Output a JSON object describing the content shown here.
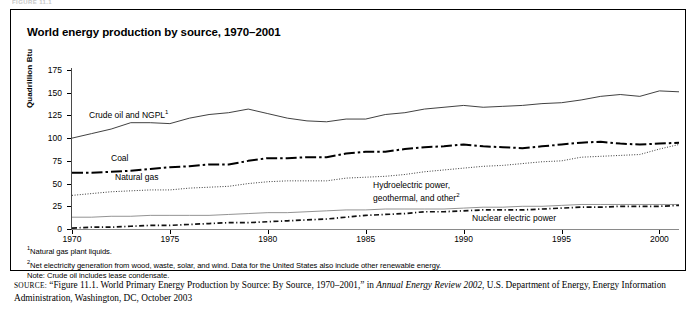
{
  "scan_header": "FIGURE 11.1",
  "figure": {
    "title": "World energy production by source, 1970–2001"
  },
  "axes": {
    "ylabel": "Quadrillion Btu",
    "yticks": [
      "0",
      "25",
      "50",
      "75",
      "100",
      "125",
      "150",
      "175"
    ],
    "xticks": [
      "1970",
      "1975",
      "1980",
      "1985",
      "1990",
      "1995",
      "2000"
    ]
  },
  "series_labels": {
    "crude_oil": "Crude oil and NGPL",
    "crude_oil_sup": "1",
    "coal": "Coal",
    "natural_gas": "Natural gas",
    "hydro_line1": "Hydroelectric power,",
    "hydro_line2": "geothermal, and other",
    "hydro_sup": "2",
    "nuclear": "Nuclear electric power"
  },
  "notes": {
    "n1_sup": "1",
    "n1": "Natural gas plant liquids.",
    "n2_sup": "2",
    "n2": "Net electricity generation from wood, waste, solar, and wind.  Data for the United States also include other renewable energy.",
    "n3": "Note: Crude oil includes lease condensate."
  },
  "source": {
    "label": "SOURCE:",
    "text_a": "“Figure 11.1. World Primary Energy Production by Source: By Source, 1970–2001,” in ",
    "italic": "Annual Energy Review 2002",
    "text_b": ", U.S. Department of Energy, Energy Information Administration, Washington, DC, October 2003"
  },
  "chart_data": {
    "type": "line",
    "title": "World energy production by source, 1970–2001",
    "xlabel": "",
    "ylabel": "Quadrillion Btu",
    "xlim": [
      1970,
      2001
    ],
    "ylim": [
      0,
      175
    ],
    "yticks": [
      0,
      25,
      50,
      75,
      100,
      125,
      150,
      175
    ],
    "xticks": [
      1970,
      1975,
      1980,
      1985,
      1990,
      1995,
      2000
    ],
    "grid": false,
    "legend": "inline-labels",
    "x": [
      1970,
      1971,
      1972,
      1973,
      1974,
      1975,
      1976,
      1977,
      1978,
      1979,
      1980,
      1981,
      1982,
      1983,
      1984,
      1985,
      1986,
      1987,
      1988,
      1989,
      1990,
      1991,
      1992,
      1993,
      1994,
      1995,
      1996,
      1997,
      1998,
      1999,
      2000,
      2001
    ],
    "series": [
      {
        "name": "Crude oil and NGPL",
        "style": "solid",
        "values": [
          100,
          105,
          110,
          117,
          117,
          116,
          122,
          126,
          128,
          132,
          127,
          122,
          119,
          118,
          121,
          121,
          126,
          128,
          132,
          134,
          136,
          134,
          135,
          136,
          138,
          139,
          142,
          146,
          148,
          146,
          152,
          151
        ]
      },
      {
        "name": "Coal",
        "style": "dash-dot",
        "values": [
          62,
          62,
          63,
          64,
          66,
          68,
          69,
          71,
          71,
          75,
          78,
          78,
          79,
          79,
          83,
          85,
          85,
          88,
          90,
          91,
          93,
          91,
          90,
          89,
          91,
          93,
          95,
          96,
          94,
          93,
          94,
          95
        ]
      },
      {
        "name": "Natural gas",
        "style": "dotted",
        "values": [
          37,
          39,
          41,
          42,
          43,
          43,
          45,
          46,
          47,
          50,
          52,
          53,
          53,
          53,
          56,
          57,
          58,
          60,
          63,
          65,
          67,
          69,
          70,
          72,
          74,
          75,
          79,
          80,
          81,
          82,
          88,
          93
        ]
      },
      {
        "name": "Hydroelectric power, geothermal, and other",
        "style": "solid-thin",
        "values": [
          13,
          13,
          14,
          14,
          15,
          15,
          15,
          15,
          16,
          17,
          18,
          18,
          19,
          20,
          21,
          21,
          22,
          22,
          22,
          22,
          23,
          24,
          24,
          25,
          25,
          26,
          27,
          27,
          27,
          27,
          27,
          27
        ]
      },
      {
        "name": "Nuclear electric power",
        "style": "fine-dash-dot",
        "values": [
          1,
          2,
          2,
          3,
          4,
          4,
          5,
          6,
          7,
          7,
          8,
          9,
          10,
          11,
          13,
          15,
          16,
          17,
          19,
          19,
          20,
          21,
          21,
          21,
          22,
          23,
          24,
          24,
          25,
          25,
          25,
          26
        ]
      }
    ]
  }
}
